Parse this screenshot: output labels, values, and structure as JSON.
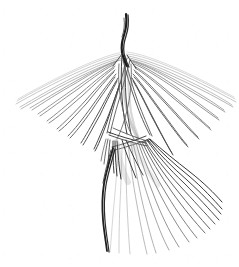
{
  "artwork": {
    "title": "Fanned Line-Stroke Figure Sketch",
    "medium": "pencil line drawing",
    "caption": "Abstract line-art sketch of a winged figure built from fanning bundles of thin strokes",
    "background_color": "#ffffff",
    "ink_color_dark": "#1a1a1a",
    "ink_color_mid": "#555555",
    "ink_color_light": "#aaaaaa",
    "ink_color_faint": "#cccccc",
    "canvas": {
      "width": 239,
      "height": 267
    },
    "parts": [
      {
        "name": "top-stem",
        "label": "Top Stem"
      },
      {
        "name": "left-wing-fan",
        "label": "Left Wing Fan"
      },
      {
        "name": "right-wing-fan",
        "label": "Right Wing Fan"
      },
      {
        "name": "center-knot",
        "label": "Center Convergence Knot"
      },
      {
        "name": "lower-skirt-fan",
        "label": "Lower Skirt Fan"
      },
      {
        "name": "left-leg",
        "label": "Left Leg Stroke"
      }
    ]
  }
}
